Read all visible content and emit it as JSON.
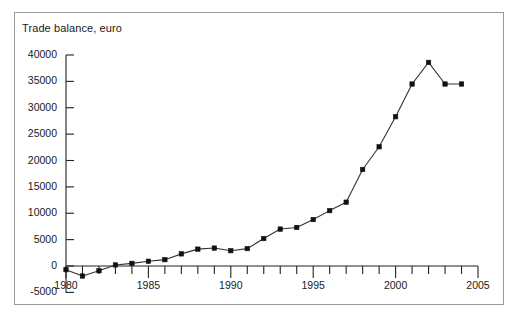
{
  "chart_data": {
    "type": "line",
    "title": "Trade balance, euro",
    "xlabel": "",
    "ylabel": "",
    "grid": false,
    "legend": null,
    "xlim": [
      1979.5,
      2005
    ],
    "ylim": [
      -5000,
      40000
    ],
    "yticks": [
      -5000,
      0,
      5000,
      10000,
      15000,
      20000,
      25000,
      30000,
      35000,
      40000
    ],
    "ytick_labels": [
      "-5000",
      "0",
      "5000",
      "10000",
      "15000",
      "20000",
      "25000",
      "30000",
      "35000",
      "40000"
    ],
    "xticks": [
      1980,
      1985,
      1990,
      1995,
      2000,
      2005
    ],
    "xtick_labels": [
      "1980",
      "1985",
      "1990",
      "1995",
      "2000",
      "2005"
    ],
    "x_minor_tick_step": 1,
    "marker": "square",
    "marker_color": "#111111",
    "line_color": "#333333",
    "x": [
      1980,
      1981,
      1982,
      1983,
      1984,
      1985,
      1986,
      1987,
      1988,
      1989,
      1990,
      1991,
      1992,
      1993,
      1994,
      1995,
      1996,
      1997,
      1998,
      1999,
      2000,
      2001,
      2002,
      2003,
      2004
    ],
    "values": [
      -700,
      -1900,
      -900,
      200,
      500,
      900,
      1200,
      2300,
      3200,
      3400,
      2900,
      3300,
      5200,
      7000,
      7300,
      8800,
      10500,
      12100,
      18300,
      22600,
      28300,
      34500,
      38600,
      34500,
      34500
    ],
    "series": [
      {
        "name": "Trade balance, euro",
        "values": [
          -700,
          -1900,
          -900,
          200,
          500,
          900,
          1200,
          2300,
          3200,
          3400,
          2900,
          3300,
          5200,
          7000,
          7300,
          8800,
          10500,
          12100,
          18300,
          22600,
          28300,
          34500,
          38600,
          34500,
          34500
        ]
      }
    ]
  },
  "colors": {
    "frame": "#9a9a9a",
    "axis": "#222222",
    "text": "#1a1a1a",
    "background": "#ffffff"
  }
}
